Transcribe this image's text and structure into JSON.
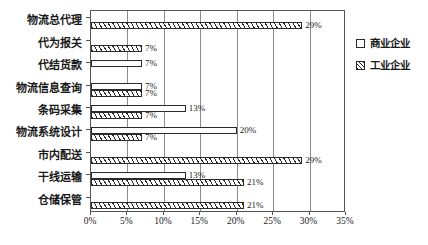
{
  "chart_data": {
    "type": "bar",
    "orientation": "horizontal",
    "title": "",
    "xlabel": "",
    "ylabel": "",
    "xlim": [
      0,
      35
    ],
    "xticks": [
      0,
      5,
      10,
      15,
      20,
      25,
      30,
      35
    ],
    "xticklabels": [
      "0%",
      "5%",
      "10%",
      "15%",
      "20%",
      "25%",
      "30%",
      "35%"
    ],
    "grid": true,
    "legend_position": "right",
    "categories": [
      "物流总代理",
      "代为报关",
      "代结货款",
      "物流信息查询",
      "条码采集",
      "物流系统设计",
      "市内配送",
      "干线运输",
      "仓储保管"
    ],
    "series": [
      {
        "name": "商业企业",
        "style": "open",
        "values": [
          0,
          0,
          7,
          7,
          13,
          20,
          0,
          13,
          0
        ],
        "labels": [
          "",
          "",
          "7%",
          "7%",
          "13%",
          "20%",
          "",
          "13%",
          ""
        ]
      },
      {
        "name": "工业企业",
        "style": "hatched",
        "values": [
          29,
          7,
          0,
          7,
          7,
          7,
          29,
          21,
          21
        ],
        "labels": [
          "29%",
          "7%",
          "",
          "7%",
          "7%",
          "7%",
          "29%",
          "21%",
          "21%"
        ]
      }
    ]
  },
  "legend": {
    "items": [
      {
        "label": "商业企业",
        "style": "open"
      },
      {
        "label": "工业企业",
        "style": "hatched"
      }
    ]
  }
}
